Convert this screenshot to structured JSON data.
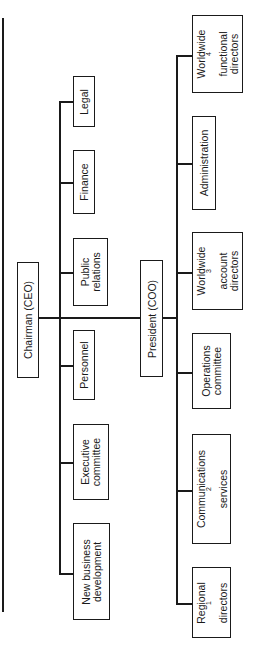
{
  "diagram": {
    "type": "org-chart",
    "orientation": "rotated-90-ccw",
    "line_color": "#1a1a1a",
    "chairman": {
      "label": "Chairman (CEO)"
    },
    "president": {
      "label": "President (COO)"
    },
    "chairman_units": [
      {
        "line1": "Legal",
        "line2": ""
      },
      {
        "line1": "Finance",
        "line2": ""
      },
      {
        "line1": "Public",
        "line2": "relations"
      },
      {
        "line1": "Personnel",
        "line2": ""
      },
      {
        "line1": "Executive",
        "line2": "committee"
      },
      {
        "line1": "New business",
        "line2": "development"
      }
    ],
    "president_units": [
      {
        "line1": "Worldwide",
        "sup": "4",
        "line2": "functional",
        "line3": "directors"
      },
      {
        "line1": "Administration"
      },
      {
        "line1": "Worldwide",
        "sup": "3",
        "line2": "account",
        "line3": "directors"
      },
      {
        "line1": "Operations",
        "line2": "committee"
      },
      {
        "line1": "Communications",
        "sup": "2",
        "line2": "services"
      },
      {
        "line1": "Regional",
        "sup": "1",
        "line2": "directors"
      }
    ]
  }
}
